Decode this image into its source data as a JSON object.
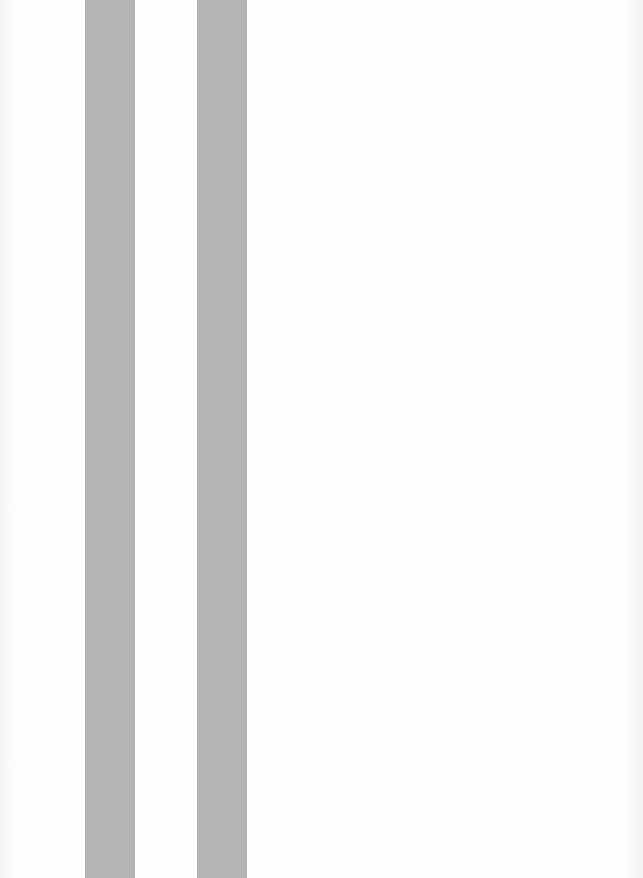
{
  "page": {
    "background_color": "#fcfcfc",
    "stripes": [
      {
        "name": "stripe-1",
        "color": "#b4b4b4",
        "x": 85,
        "width": 50
      },
      {
        "name": "stripe-2",
        "color": "#b4b4b4",
        "x": 197,
        "width": 50
      }
    ]
  }
}
